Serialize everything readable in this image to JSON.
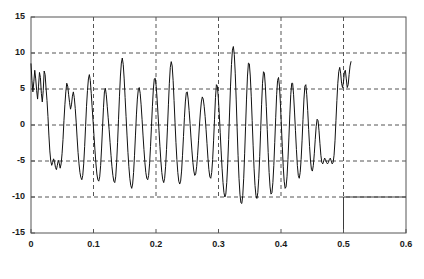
{
  "chart_data": {
    "type": "line",
    "title": "",
    "subtitle": "",
    "xlabel": "",
    "ylabel": "",
    "xlim": [
      0,
      0.6
    ],
    "ylim": [
      -15,
      15
    ],
    "xticks": [
      0,
      0.1,
      0.2,
      0.3,
      0.4,
      0.5,
      0.6
    ],
    "xtick_labels": [
      "0",
      "0.1",
      "0.2",
      "0.3",
      "0.4",
      "0.5",
      "0.6"
    ],
    "yticks": [
      -15,
      -10,
      -5,
      0,
      5,
      10,
      15
    ],
    "ytick_labels": [
      "-15",
      "-10",
      "-5",
      "0",
      "5",
      "10",
      "15"
    ],
    "grid": true,
    "grid_style": "dashed",
    "legend": null,
    "legend_position": "none",
    "line_color": "#111111",
    "grid_color": "#555555",
    "background": "#ffffff",
    "annotations": [
      {
        "name": "baseline-segment",
        "type": "hline",
        "y": -10,
        "x_start": 0.5,
        "x_end": 0.6,
        "style": "solid"
      },
      {
        "name": "vertical-divider",
        "type": "vline",
        "x": 0.5,
        "y_start": -15,
        "y_end": -10,
        "style": "solid"
      }
    ],
    "series": [
      {
        "name": "waveform",
        "x_start": 0.0,
        "x_end": 0.512,
        "n_points": 341,
        "values": [
          8.5,
          6.2,
          4.6,
          6.0,
          7.6,
          6.4,
          4.8,
          3.6,
          5.4,
          7.3,
          6.6,
          4.4,
          3.2,
          4.8,
          7.5,
          7.0,
          5.1,
          3.4,
          1.2,
          -1.4,
          -3.6,
          -5.0,
          -5.6,
          -5.2,
          -4.7,
          -5.1,
          -5.9,
          -6.2,
          -5.6,
          -4.9,
          -5.3,
          -6.0,
          -5.4,
          -4.0,
          -2.0,
          0.6,
          2.8,
          4.6,
          5.8,
          5.4,
          4.2,
          3.1,
          2.2,
          2.8,
          4.0,
          4.6,
          3.8,
          2.3,
          0.4,
          -1.8,
          -3.8,
          -5.4,
          -6.6,
          -7.3,
          -7.6,
          -7.0,
          -5.4,
          -3.0,
          -0.2,
          2.6,
          4.8,
          6.4,
          7.0,
          6.2,
          4.4,
          2.4,
          0.4,
          -1.6,
          -3.6,
          -5.4,
          -6.8,
          -7.6,
          -7.8,
          -7.2,
          -5.6,
          -3.2,
          -0.4,
          2.4,
          4.6,
          5.1,
          4.2,
          2.6,
          1.0,
          -0.6,
          -2.4,
          -4.2,
          -5.8,
          -7.0,
          -7.8,
          -8.0,
          -7.2,
          -5.2,
          -2.4,
          0.8,
          4.0,
          6.8,
          8.6,
          9.3,
          8.4,
          6.4,
          3.8,
          1.2,
          -1.4,
          -3.8,
          -5.8,
          -7.4,
          -8.4,
          -8.8,
          -8.2,
          -6.6,
          -4.2,
          -1.4,
          1.4,
          3.6,
          4.9,
          5.2,
          4.4,
          2.8,
          0.8,
          -1.4,
          -3.4,
          -5.2,
          -6.6,
          -7.4,
          -7.6,
          -7.0,
          -5.4,
          -3.0,
          -0.2,
          2.6,
          5.0,
          6.4,
          6.5,
          5.4,
          3.6,
          1.4,
          -0.8,
          -3.0,
          -5.0,
          -6.6,
          -7.6,
          -8.0,
          -7.4,
          -5.8,
          -3.4,
          -0.4,
          2.8,
          5.8,
          8.0,
          8.8,
          8.2,
          6.2,
          3.4,
          0.4,
          -2.4,
          -4.8,
          -6.6,
          -7.8,
          -8.2,
          -7.8,
          -6.4,
          -4.2,
          -1.6,
          1.0,
          3.2,
          4.5,
          4.6,
          3.6,
          2.0,
          0.2,
          -1.8,
          -3.6,
          -5.2,
          -6.4,
          -7.0,
          -6.8,
          -5.8,
          -4.2,
          -2.2,
          0.0,
          1.8,
          3.2,
          3.9,
          3.6,
          2.6,
          1.2,
          -0.6,
          -2.6,
          -4.6,
          -6.2,
          -7.2,
          -7.4,
          -6.6,
          -4.8,
          -2.2,
          0.8,
          3.8,
          5.6,
          5.4,
          3.8,
          1.6,
          -1.0,
          -3.6,
          -6.0,
          -8.0,
          -9.4,
          -10.0,
          -9.6,
          -8.0,
          -5.4,
          -2.0,
          1.8,
          5.4,
          8.4,
          10.4,
          10.9,
          9.8,
          7.2,
          3.6,
          -0.4,
          -4.2,
          -7.4,
          -9.6,
          -10.8,
          -10.9,
          -9.8,
          -7.4,
          -4.0,
          -0.2,
          3.6,
          6.8,
          8.6,
          8.5,
          6.8,
          4.0,
          0.6,
          -2.8,
          -6.0,
          -8.4,
          -9.8,
          -10.2,
          -9.4,
          -7.4,
          -4.4,
          -0.8,
          2.8,
          5.8,
          7.4,
          7.2,
          5.4,
          2.6,
          -0.6,
          -3.8,
          -6.6,
          -8.6,
          -9.6,
          -9.4,
          -8.0,
          -5.6,
          -2.4,
          1.0,
          4.2,
          6.2,
          6.6,
          5.4,
          3.0,
          0.0,
          -3.0,
          -5.8,
          -7.8,
          -8.8,
          -8.6,
          -7.2,
          -4.8,
          -1.8,
          1.4,
          4.2,
          5.8,
          5.8,
          4.2,
          1.8,
          -0.8,
          -3.4,
          -5.6,
          -7.0,
          -7.4,
          -6.6,
          -4.8,
          -2.2,
          0.8,
          3.6,
          5.4,
          5.6,
          4.2,
          2.0,
          -0.6,
          -3.0,
          -5.0,
          -6.2,
          -6.4,
          -5.6,
          -4.0,
          -2.0,
          -0.2,
          0.8,
          0.6,
          -0.8,
          -2.6,
          -4.2,
          -5.2,
          -5.4,
          -5.0,
          -4.6,
          -4.8,
          -5.2,
          -5.4,
          -5.2,
          -4.8,
          -4.6,
          -5.0,
          -5.4,
          -5.2,
          -4.2,
          -2.2,
          0.6,
          3.4,
          5.8,
          7.4,
          8.0,
          7.2,
          5.8,
          5.2,
          6.0,
          7.4,
          7.6,
          6.4,
          5.2,
          5.6,
          7.0,
          8.2,
          8.8
        ]
      }
    ]
  }
}
